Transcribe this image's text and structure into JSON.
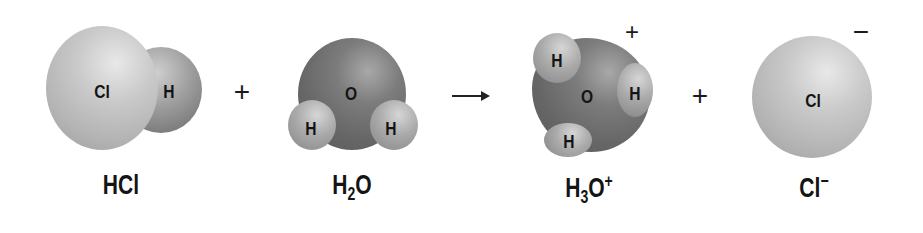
{
  "reaction": {
    "reactants": [
      {
        "formula": {
          "main": "HCl",
          "parts": [
            "HCl"
          ]
        },
        "atoms": [
          {
            "symbol": "Cl"
          },
          {
            "symbol": "H"
          }
        ]
      },
      {
        "formula": {
          "parts": [
            "H",
            "2",
            "O"
          ]
        },
        "atoms": [
          {
            "symbol": "O"
          },
          {
            "symbol": "H"
          },
          {
            "symbol": "H"
          }
        ]
      }
    ],
    "products": [
      {
        "formula": {
          "parts": [
            "H",
            "3",
            "O",
            "+"
          ]
        },
        "charge": "+",
        "atoms": [
          {
            "symbol": "H"
          },
          {
            "symbol": "O"
          },
          {
            "symbol": "H"
          },
          {
            "symbol": "H"
          }
        ]
      },
      {
        "formula": {
          "parts": [
            "Cl",
            "−"
          ]
        },
        "charge": "−",
        "atoms": [
          {
            "symbol": "Cl"
          }
        ]
      }
    ],
    "operators": {
      "plus1": "+",
      "plus2": "+"
    }
  },
  "colors": {
    "chlorine": "#bdbdbd",
    "hydrogen": "#9a9a9a",
    "oxygen": "#6e6e6e",
    "text": "#141414"
  }
}
